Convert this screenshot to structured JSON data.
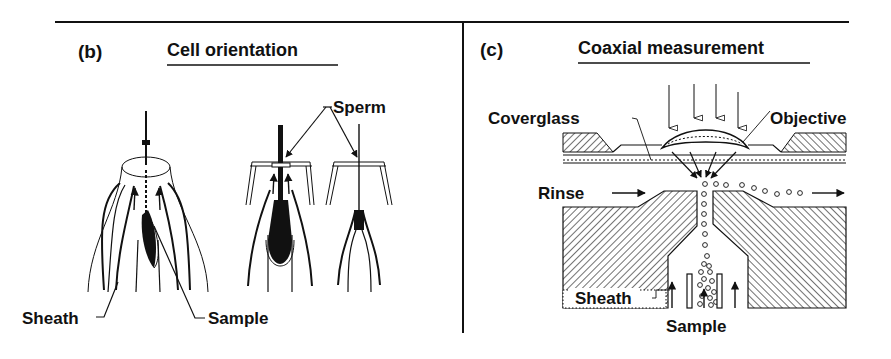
{
  "figure": {
    "panels": [
      {
        "id": "b",
        "tag": "(b)",
        "title": "Cell orientation",
        "labels": {
          "sperm": "Sperm",
          "sheath": "Sheath",
          "sample": "Sample"
        }
      },
      {
        "id": "c",
        "tag": "(c)",
        "title": "Coaxial measurement",
        "labels": {
          "coverglass": "Coverglass",
          "objective": "Objective",
          "rinse": "Rinse",
          "sheath": "Sheath",
          "sample": "Sample"
        }
      }
    ],
    "colors": {
      "ink": "#111111",
      "background": "#ffffff"
    }
  }
}
